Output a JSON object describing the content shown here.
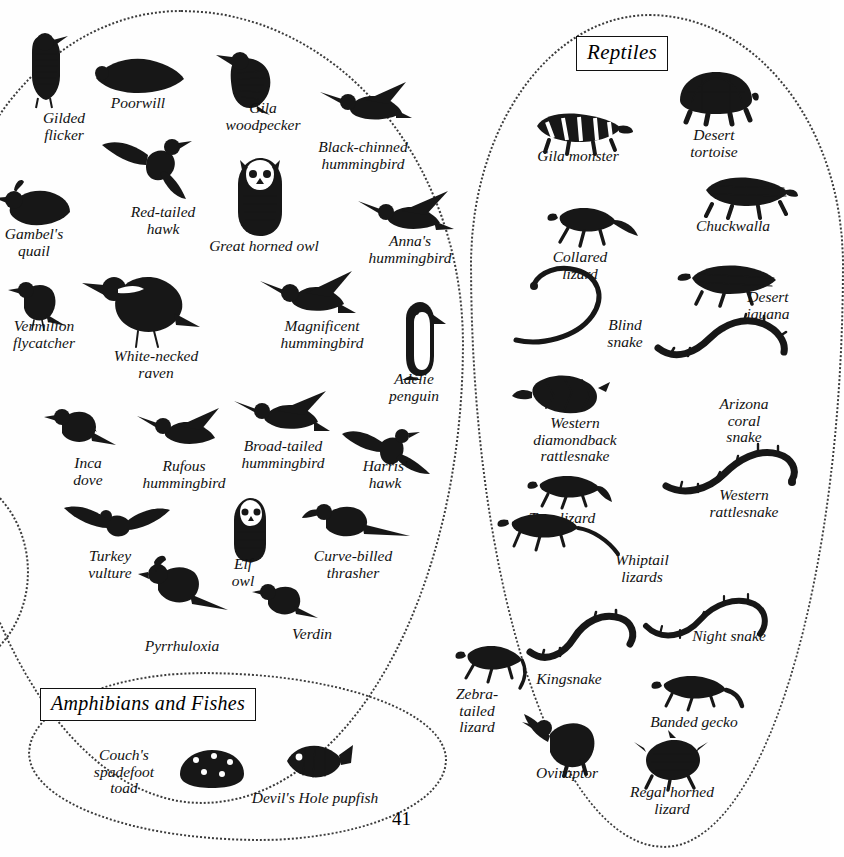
{
  "page": {
    "number": "41",
    "sections": [
      {
        "id": "birds",
        "title": ""
      },
      {
        "id": "reptiles",
        "title": "Reptiles"
      },
      {
        "id": "amphibians",
        "title": "Amphibians and Fishes"
      }
    ]
  },
  "birds": [
    {
      "name": "Gilded\nflicker",
      "caption_x": 64,
      "caption_y": 110,
      "art_x": 12,
      "art_y": 30,
      "art": "flicker"
    },
    {
      "name": "Poorwill",
      "caption_x": 138,
      "caption_y": 95,
      "art_x": 88,
      "art_y": 48,
      "art": "poorwill"
    },
    {
      "name": "Gila\nwoodpecker",
      "caption_x": 263,
      "caption_y": 100,
      "art_x": 210,
      "art_y": 45,
      "art": "woodpecker"
    },
    {
      "name": "Black-chinned\nhummingbird",
      "caption_x": 363,
      "caption_y": 139,
      "art_x": 318,
      "art_y": 78,
      "art": "hummer1"
    },
    {
      "name": "Gambel's\nquail",
      "caption_x": 34,
      "caption_y": 226,
      "art_x": -6,
      "art_y": 170,
      "art": "quail"
    },
    {
      "name": "Red-tailed\nhawk",
      "caption_x": 163,
      "caption_y": 204,
      "art_x": 100,
      "art_y": 125,
      "art": "hawk1"
    },
    {
      "name": "Great horned owl",
      "caption_x": 264,
      "caption_y": 238,
      "art_x": 218,
      "art_y": 150,
      "art": "owl1"
    },
    {
      "name": "Anna's\nhummingbird",
      "caption_x": 410,
      "caption_y": 233,
      "art_x": 352,
      "art_y": 185,
      "art": "hummer2"
    },
    {
      "name": "Vermilion\nflycatcher",
      "caption_x": 44,
      "caption_y": 318,
      "art_x": 8,
      "art_y": 270,
      "art": "flycatcher"
    },
    {
      "name": "White-necked\nraven",
      "caption_x": 156,
      "caption_y": 348,
      "art_x": 82,
      "art_y": 255,
      "art": "raven"
    },
    {
      "name": "Magnificent\nhummingbird",
      "caption_x": 322,
      "caption_y": 318,
      "art_x": 258,
      "art_y": 265,
      "art": "hummer3"
    },
    {
      "name": "Adélie\npenguin",
      "caption_x": 414,
      "caption_y": 371,
      "art_x": 388,
      "art_y": 300,
      "art": "penguin"
    },
    {
      "name": "Inca\ndove",
      "caption_x": 88,
      "caption_y": 455,
      "art_x": 42,
      "art_y": 395,
      "art": "dove"
    },
    {
      "name": "Rufous\nhummingbird",
      "caption_x": 184,
      "caption_y": 458,
      "art_x": 135,
      "art_y": 400,
      "art": "hummer4"
    },
    {
      "name": "Broad-tailed\nhummingbird",
      "caption_x": 283,
      "caption_y": 438,
      "art_x": 232,
      "art_y": 385,
      "art": "hummer5"
    },
    {
      "name": "Harris'\nhawk",
      "caption_x": 385,
      "caption_y": 458,
      "art_x": 340,
      "art_y": 420,
      "art": "hawk2"
    },
    {
      "name": "Turkey\nvulture",
      "caption_x": 110,
      "caption_y": 548,
      "art_x": 62,
      "art_y": 500,
      "art": "vulture"
    },
    {
      "name": "Elf\nowl",
      "caption_x": 243,
      "caption_y": 556,
      "art_x": 218,
      "art_y": 490,
      "art": "owl2"
    },
    {
      "name": "Curve-billed\nthrasher",
      "caption_x": 353,
      "caption_y": 548,
      "art_x": 300,
      "art_y": 490,
      "art": "thrasher"
    },
    {
      "name": "Pyrrhuloxia",
      "caption_x": 182,
      "caption_y": 638,
      "art_x": 132,
      "art_y": 548,
      "art": "pyrrhuloxia"
    },
    {
      "name": "Verdin",
      "caption_x": 312,
      "caption_y": 626,
      "art_x": 248,
      "art_y": 570,
      "art": "verdin"
    }
  ],
  "reptiles": [
    {
      "name": "Gila monster",
      "caption_x": 578,
      "caption_y": 148,
      "art_x": 523,
      "art_y": 96,
      "art": "gila"
    },
    {
      "name": "Desert\ntortoise",
      "caption_x": 714,
      "caption_y": 127,
      "art_x": 668,
      "art_y": 62,
      "art": "tortoise"
    },
    {
      "name": "Chuckwalla",
      "caption_x": 733,
      "caption_y": 218,
      "art_x": 688,
      "art_y": 162,
      "art": "chuckwalla"
    },
    {
      "name": "Collared\nlizard",
      "caption_x": 580,
      "caption_y": 249,
      "art_x": 538,
      "art_y": 190,
      "art": "collared"
    },
    {
      "name": "Desert\niguana",
      "caption_x": 768,
      "caption_y": 289,
      "art_x": 672,
      "art_y": 252,
      "art": "iguana"
    },
    {
      "name": "Blind\nsnake",
      "caption_x": 625,
      "caption_y": 317,
      "art_x": 510,
      "art_y": 262,
      "art": "blindsnake"
    },
    {
      "name": "Arizona\ncoral\nsnake",
      "caption_x": 744,
      "caption_y": 396,
      "art_x": 652,
      "art_y": 300,
      "art": "coralsnake"
    },
    {
      "name": "Western\ndiamondback\nrattlesnake",
      "caption_x": 575,
      "caption_y": 415,
      "art_x": 510,
      "art_y": 362,
      "art": "diamondback"
    },
    {
      "name": "Western\nrattlesnake",
      "caption_x": 744,
      "caption_y": 487,
      "art_x": 660,
      "art_y": 420,
      "art": "rattler"
    },
    {
      "name": "Tree lizard",
      "caption_x": 562,
      "caption_y": 510,
      "art_x": 518,
      "art_y": 462,
      "art": "treelizard"
    },
    {
      "name": "Whiptail\nlizards",
      "caption_x": 642,
      "caption_y": 552,
      "art_x": 486,
      "art_y": 498,
      "art": "whiptail1"
    },
    {
      "name": "Night snake",
      "caption_x": 729,
      "caption_y": 628,
      "art_x": 640,
      "art_y": 578,
      "art": "nightsnake"
    },
    {
      "name": "Kingsnake",
      "caption_x": 569,
      "caption_y": 671,
      "art_x": 520,
      "art_y": 592,
      "art": "kingsnake"
    },
    {
      "name": "Zebra-\ntailed\nlizard",
      "caption_x": 477,
      "caption_y": 686,
      "art_x": 442,
      "art_y": 630,
      "art": "zebratail"
    },
    {
      "name": "Banded gecko",
      "caption_x": 694,
      "caption_y": 714,
      "art_x": 640,
      "art_y": 660,
      "art": "gecko"
    },
    {
      "name": "Oviraptor",
      "caption_x": 567,
      "caption_y": 765,
      "art_x": 520,
      "art_y": 700,
      "art": "oviraptor"
    },
    {
      "name": "Regal horned\nlizard",
      "caption_x": 672,
      "caption_y": 784,
      "art_x": 630,
      "art_y": 730,
      "art": "hornedlizard"
    }
  ],
  "amphibians": [
    {
      "name": "Couch's\nspadefoot\ntoad",
      "caption_x": 124,
      "caption_y": 747,
      "art_x": 170,
      "art_y": 742,
      "art": "toad"
    },
    {
      "name": "Devil's Hole pupfish",
      "caption_x": 315,
      "caption_y": 790,
      "art_x": 275,
      "art_y": 735,
      "art": "pupfish"
    }
  ]
}
